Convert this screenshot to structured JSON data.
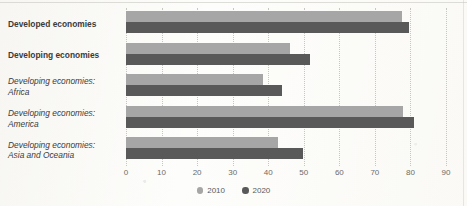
{
  "chart_data": {
    "type": "bar",
    "orientation": "horizontal",
    "title": "",
    "subtitle": "",
    "xlabel": "",
    "ylabel": "",
    "xlim": [
      0,
      90
    ],
    "xticks": [
      0,
      10,
      20,
      30,
      40,
      50,
      60,
      70,
      80,
      90
    ],
    "xtick_labels": [
      "0",
      "10",
      "20",
      "30",
      "40",
      "50",
      "60",
      "70",
      "80",
      "90"
    ],
    "grid": "vertical-dotted",
    "legend_position": "bottom-center",
    "categories": [
      "Developed economies",
      "Developing economies",
      "Developing economies: Africa",
      "Developing economies: America",
      "Developing economies: Asia and Oceania"
    ],
    "category_lines": [
      [
        "Developed economies"
      ],
      [
        "Developing economies"
      ],
      [
        "Developing economies:",
        "Africa"
      ],
      [
        "Developing economies:",
        "America"
      ],
      [
        "Developing economies:",
        "Asia and Oceania"
      ]
    ],
    "category_styles": [
      "bold",
      "bold",
      "italic",
      "italic",
      "italic"
    ],
    "series": [
      {
        "name": "2010",
        "color": "#a6a6a6",
        "values": [
          77.6,
          46.0,
          38.5,
          77.9,
          42.8
        ]
      },
      {
        "name": "2020",
        "color": "#595959",
        "values": [
          79.6,
          51.7,
          43.9,
          81.0,
          49.8
        ]
      }
    ]
  },
  "legend": {
    "items": [
      {
        "label": "2010",
        "color": "#a6a6a6"
      },
      {
        "label": "2020",
        "color": "#595959"
      }
    ]
  },
  "colors": {
    "series_2010": "#a6a6a6",
    "series_2020": "#595959",
    "gridline": "#c8c6c0",
    "axis_text": "#6b6b6b",
    "category_text": "#3b3b3b",
    "background": "#fdfdfb"
  }
}
